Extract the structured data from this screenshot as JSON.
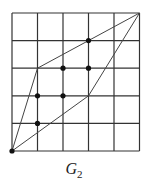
{
  "figure": {
    "label": "G",
    "subscript": "2",
    "grid": {
      "columns": 5,
      "rows": 5,
      "origin_px": [
        12,
        151
      ],
      "cell_px": [
        25.5,
        27.6
      ],
      "line_color": "#333333"
    },
    "polygon": {
      "vertices": [
        [
          0,
          0
        ],
        [
          1,
          3
        ],
        [
          5,
          5
        ],
        [
          3,
          2
        ]
      ],
      "stroke": "#444444"
    },
    "points": [
      [
        0,
        0
      ],
      [
        1,
        1
      ],
      [
        1,
        2
      ],
      [
        2,
        2
      ],
      [
        2,
        3
      ],
      [
        3,
        3
      ],
      [
        3,
        4
      ]
    ],
    "point_color": "#111111"
  }
}
